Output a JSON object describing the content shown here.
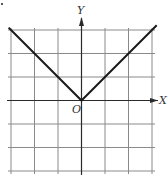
{
  "chart_data": {
    "type": "line",
    "title": "",
    "function": "y = |x|",
    "xlabel": "X",
    "ylabel": "Y",
    "origin_label": "O",
    "xlim": [
      -3,
      3
    ],
    "ylim": [
      -3,
      3
    ],
    "grid": true,
    "tick_labels_shown": false,
    "series": [
      {
        "name": "y = |x|",
        "x": [
          -3.1,
          -3,
          -2,
          -1,
          0,
          1,
          2,
          3,
          3.2
        ],
        "y": [
          3.1,
          3,
          2,
          1,
          0,
          1,
          2,
          3,
          3.2
        ]
      }
    ]
  },
  "colors": {
    "grid": "#8a8a8a",
    "axis": "#2a2a2a",
    "curve": "#1a1a1a",
    "background": "#ffffff"
  }
}
